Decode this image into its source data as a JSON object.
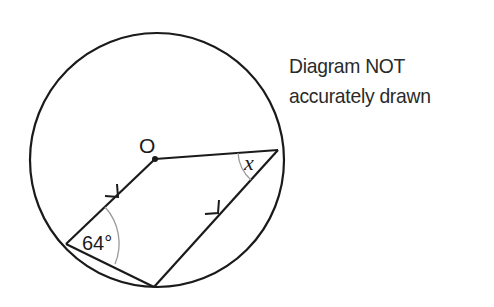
{
  "note": {
    "line1": "Diagram NOT",
    "line2": "accurately drawn"
  },
  "labels": {
    "center": "O",
    "angle_given": "64°",
    "angle_unknown": "x"
  },
  "geometry": {
    "circle": {
      "cx": 157,
      "cy": 160,
      "r": 127
    },
    "points": {
      "O": [
        155,
        159
      ],
      "A": [
        66,
        244
      ],
      "B": [
        154,
        287
      ],
      "C": [
        278,
        150
      ]
    },
    "segments": [
      "O-A",
      "A-B",
      "B-C",
      "C-O"
    ],
    "parallel_marks": [
      "O-A",
      "B-C"
    ]
  },
  "colors": {
    "stroke": "#1a1a1a",
    "angle_arc": "#9a9a9a",
    "text": "#2a2a2a"
  }
}
